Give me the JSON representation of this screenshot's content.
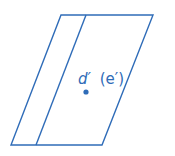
{
  "diagram": {
    "type": "descriptive-geometry-projection",
    "stroke_color": "#2f6cb8",
    "outer_parallelogram": {
      "points": [
        [
          61,
          15
        ],
        [
          153,
          15
        ],
        [
          102,
          145
        ],
        [
          11,
          145
        ]
      ]
    },
    "inner_line": {
      "x1": 86,
      "y1": 15,
      "x2": 36,
      "y2": 145
    },
    "point": {
      "x": 86,
      "y": 92,
      "r": 2.6,
      "name": "d-prime-point"
    },
    "label": {
      "main": "d′",
      "paren": "(e′)",
      "x": 78,
      "y": 84
    }
  }
}
